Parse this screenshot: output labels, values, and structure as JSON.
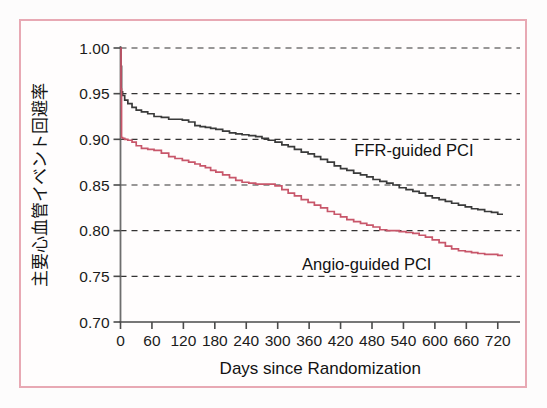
{
  "figure": {
    "frame_color": "#e8a9b4",
    "background": "#fffdfd"
  },
  "chart_data": {
    "type": "line",
    "title": "",
    "subtitle": "",
    "xlabel": "Days since Randomization",
    "ylabel": "主要心血管イベント回避率",
    "ylabel_note": "Major cardiovascular event-free rate (vertical Japanese text, rotated 90° CCW)",
    "xlim": [
      0,
      730
    ],
    "ylim": [
      0.7,
      1.0
    ],
    "xticks": [
      0,
      60,
      120,
      180,
      240,
      300,
      360,
      420,
      480,
      540,
      600,
      660,
      720
    ],
    "xticklabels": [
      "0",
      "60",
      "120",
      "180",
      "240",
      "300",
      "360",
      "420",
      "480",
      "540",
      "600",
      "660",
      "720"
    ],
    "yticks": [
      0.7,
      0.75,
      0.8,
      0.85,
      0.9,
      0.95,
      1.0
    ],
    "yticklabels": [
      "0.70",
      "0.75",
      "0.80",
      "0.85",
      "0.90",
      "0.95",
      "1.00"
    ],
    "grid": "horizontal-dashed",
    "gridline_color": "#333333",
    "legend_position": "inline-annotation",
    "step_type": "post",
    "series": [
      {
        "name": "FFR-guided PCI",
        "color": "#3a3a3a",
        "label_x_days": 560,
        "label_y_value": 0.882,
        "x": [
          0,
          1,
          2,
          4,
          8,
          14,
          22,
          30,
          40,
          52,
          64,
          78,
          92,
          104,
          118,
          130,
          142,
          152,
          162,
          172,
          182,
          195,
          208,
          220,
          232,
          245,
          258,
          270,
          282,
          295,
          308,
          320,
          332,
          345,
          358,
          370,
          382,
          395,
          408,
          420,
          432,
          445,
          458,
          470,
          482,
          495,
          508,
          520,
          532,
          545,
          558,
          570,
          582,
          595,
          608,
          620,
          632,
          645,
          658,
          670,
          682,
          695,
          708,
          720,
          730
        ],
        "y": [
          1.0,
          0.98,
          0.952,
          0.948,
          0.943,
          0.939,
          0.935,
          0.932,
          0.93,
          0.928,
          0.925,
          0.924,
          0.922,
          0.922,
          0.921,
          0.919,
          0.915,
          0.914,
          0.913,
          0.912,
          0.911,
          0.909,
          0.907,
          0.906,
          0.905,
          0.904,
          0.903,
          0.901,
          0.899,
          0.897,
          0.894,
          0.892,
          0.889,
          0.886,
          0.884,
          0.881,
          0.878,
          0.875,
          0.871,
          0.868,
          0.866,
          0.863,
          0.861,
          0.859,
          0.856,
          0.854,
          0.852,
          0.85,
          0.847,
          0.845,
          0.843,
          0.841,
          0.838,
          0.836,
          0.834,
          0.832,
          0.83,
          0.828,
          0.826,
          0.824,
          0.823,
          0.821,
          0.82,
          0.818,
          0.818
        ]
      },
      {
        "name": "Angio-guided PCI",
        "color": "#c8566a",
        "label_x_days": 470,
        "label_y_value": 0.757,
        "x": [
          0,
          1,
          2,
          4,
          8,
          14,
          22,
          30,
          40,
          52,
          64,
          78,
          92,
          104,
          118,
          130,
          142,
          152,
          162,
          172,
          182,
          195,
          208,
          220,
          232,
          245,
          258,
          270,
          282,
          295,
          308,
          320,
          332,
          345,
          358,
          370,
          382,
          395,
          408,
          420,
          432,
          445,
          458,
          470,
          482,
          495,
          508,
          520,
          532,
          545,
          558,
          570,
          582,
          595,
          608,
          620,
          632,
          645,
          658,
          670,
          682,
          695,
          708,
          720,
          730
        ],
        "y": [
          1.0,
          0.955,
          0.902,
          0.901,
          0.9,
          0.899,
          0.897,
          0.893,
          0.89,
          0.889,
          0.888,
          0.885,
          0.881,
          0.879,
          0.877,
          0.875,
          0.873,
          0.871,
          0.869,
          0.866,
          0.864,
          0.861,
          0.858,
          0.855,
          0.853,
          0.852,
          0.851,
          0.851,
          0.851,
          0.849,
          0.845,
          0.841,
          0.838,
          0.834,
          0.831,
          0.828,
          0.825,
          0.821,
          0.818,
          0.815,
          0.812,
          0.81,
          0.808,
          0.806,
          0.804,
          0.801,
          0.8,
          0.8,
          0.799,
          0.798,
          0.797,
          0.795,
          0.793,
          0.79,
          0.787,
          0.783,
          0.78,
          0.778,
          0.777,
          0.776,
          0.775,
          0.774,
          0.774,
          0.773,
          0.773
        ]
      }
    ]
  }
}
